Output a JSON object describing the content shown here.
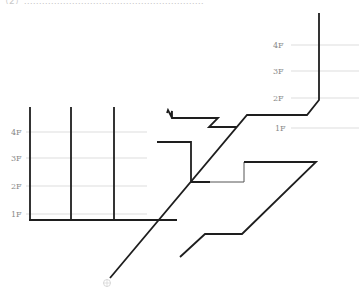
{
  "header": {
    "cutoff_text": "（2）……………………………………………………"
  },
  "left_riser_group": {
    "floor_labels": [
      "4F",
      "3F",
      "2F",
      "1F"
    ]
  },
  "right_riser_group": {
    "floor_labels": [
      "4F",
      "3F",
      "2F",
      "1F"
    ]
  },
  "colors": {
    "pipe": "#1e1e1e",
    "guide": "#d4d4d4",
    "label": "#8a8a8a"
  }
}
